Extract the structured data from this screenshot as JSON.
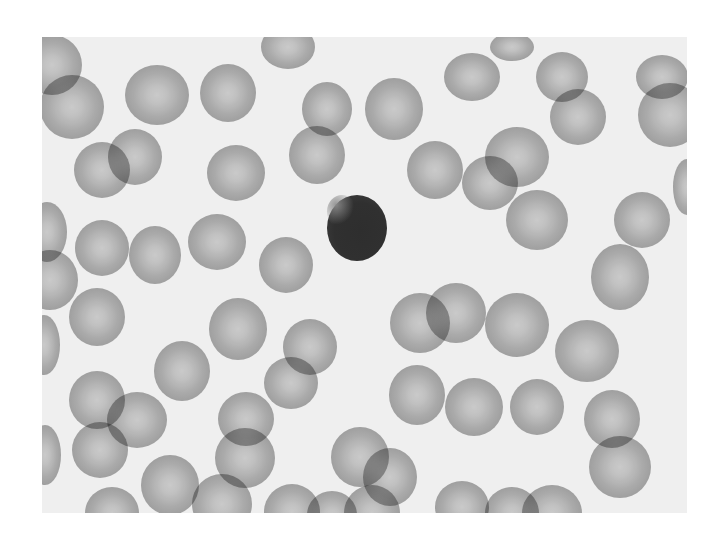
{
  "image": {
    "subject": "Peripheral blood smear micrograph (grayscale)",
    "description": "Numerous red blood cells with central pallor surrounding a single dark-staining small lymphocyte near the center",
    "background_color": "#efefef",
    "page_background": "#ffffff",
    "rbc_color": "#a8a8a8",
    "rbc_pallor_color": "#d6d6d6",
    "lymphocyte_color": "#303030"
  },
  "frame": {
    "x": 42,
    "y": 37,
    "width": 645,
    "height": 476
  },
  "lymphocyte": {
    "cx": 357,
    "cy": 228,
    "rx": 30,
    "ry": 33
  },
  "cells": [
    {
      "cx": 10,
      "cy": 28,
      "rx": 30,
      "ry": 30
    },
    {
      "cx": 30,
      "cy": 70,
      "rx": 32,
      "ry": 32
    },
    {
      "cx": 115,
      "cy": 58,
      "rx": 32,
      "ry": 30
    },
    {
      "cx": 186,
      "cy": 56,
      "rx": 28,
      "ry": 29
    },
    {
      "cx": 246,
      "cy": 10,
      "rx": 27,
      "ry": 22
    },
    {
      "cx": 285,
      "cy": 72,
      "rx": 25,
      "ry": 27
    },
    {
      "cx": 352,
      "cy": 72,
      "rx": 29,
      "ry": 31
    },
    {
      "cx": 430,
      "cy": 40,
      "rx": 28,
      "ry": 24
    },
    {
      "cx": 470,
      "cy": 10,
      "rx": 22,
      "ry": 14
    },
    {
      "cx": 520,
      "cy": 40,
      "rx": 26,
      "ry": 25
    },
    {
      "cx": 536,
      "cy": 80,
      "rx": 28,
      "ry": 28
    },
    {
      "cx": 620,
      "cy": 40,
      "rx": 26,
      "ry": 22
    },
    {
      "cx": 628,
      "cy": 78,
      "rx": 32,
      "ry": 32
    },
    {
      "cx": 645,
      "cy": 150,
      "rx": 14,
      "ry": 28
    },
    {
      "cx": 60,
      "cy": 133,
      "rx": 28,
      "ry": 28
    },
    {
      "cx": 93,
      "cy": 120,
      "rx": 27,
      "ry": 28
    },
    {
      "cx": 194,
      "cy": 136,
      "rx": 29,
      "ry": 28
    },
    {
      "cx": 275,
      "cy": 118,
      "rx": 28,
      "ry": 29
    },
    {
      "cx": 393,
      "cy": 133,
      "rx": 28,
      "ry": 29
    },
    {
      "cx": 475,
      "cy": 120,
      "rx": 32,
      "ry": 30
    },
    {
      "cx": 448,
      "cy": 146,
      "rx": 28,
      "ry": 27
    },
    {
      "cx": 600,
      "cy": 183,
      "rx": 28,
      "ry": 28
    },
    {
      "cx": 5,
      "cy": 195,
      "rx": 20,
      "ry": 30
    },
    {
      "cx": 60,
      "cy": 211,
      "rx": 27,
      "ry": 28
    },
    {
      "cx": 113,
      "cy": 218,
      "rx": 26,
      "ry": 29
    },
    {
      "cx": 175,
      "cy": 205,
      "rx": 29,
      "ry": 28
    },
    {
      "cx": 244,
      "cy": 228,
      "rx": 27,
      "ry": 28
    },
    {
      "cx": 495,
      "cy": 183,
      "rx": 31,
      "ry": 30
    },
    {
      "cx": 578,
      "cy": 240,
      "rx": 29,
      "ry": 33
    },
    {
      "cx": 8,
      "cy": 243,
      "rx": 28,
      "ry": 30
    },
    {
      "cx": 55,
      "cy": 280,
      "rx": 28,
      "ry": 29
    },
    {
      "cx": 196,
      "cy": 292,
      "rx": 29,
      "ry": 31
    },
    {
      "cx": 378,
      "cy": 286,
      "rx": 30,
      "ry": 30
    },
    {
      "cx": 414,
      "cy": 276,
      "rx": 30,
      "ry": 30
    },
    {
      "cx": 475,
      "cy": 288,
      "rx": 32,
      "ry": 32
    },
    {
      "cx": 140,
      "cy": 334,
      "rx": 28,
      "ry": 30
    },
    {
      "cx": 249,
      "cy": 346,
      "rx": 27,
      "ry": 26
    },
    {
      "cx": 204,
      "cy": 382,
      "rx": 28,
      "ry": 27
    },
    {
      "cx": 268,
      "cy": 310,
      "rx": 27,
      "ry": 28
    },
    {
      "cx": 2,
      "cy": 308,
      "rx": 16,
      "ry": 30
    },
    {
      "cx": 545,
      "cy": 314,
      "rx": 32,
      "ry": 31
    },
    {
      "cx": 375,
      "cy": 358,
      "rx": 28,
      "ry": 30
    },
    {
      "cx": 432,
      "cy": 370,
      "rx": 29,
      "ry": 29
    },
    {
      "cx": 495,
      "cy": 370,
      "rx": 27,
      "ry": 28
    },
    {
      "cx": 570,
      "cy": 382,
      "rx": 28,
      "ry": 29
    },
    {
      "cx": 578,
      "cy": 430,
      "rx": 31,
      "ry": 31
    },
    {
      "cx": 55,
      "cy": 363,
      "rx": 28,
      "ry": 29
    },
    {
      "cx": 95,
      "cy": 383,
      "rx": 30,
      "ry": 28
    },
    {
      "cx": 58,
      "cy": 413,
      "rx": 28,
      "ry": 28
    },
    {
      "cx": 3,
      "cy": 418,
      "rx": 16,
      "ry": 30
    },
    {
      "cx": 128,
      "cy": 448,
      "rx": 29,
      "ry": 30
    },
    {
      "cx": 203,
      "cy": 421,
      "rx": 30,
      "ry": 30
    },
    {
      "cx": 180,
      "cy": 467,
      "rx": 30,
      "ry": 30
    },
    {
      "cx": 250,
      "cy": 475,
      "rx": 28,
      "ry": 28
    },
    {
      "cx": 318,
      "cy": 420,
      "rx": 29,
      "ry": 30
    },
    {
      "cx": 348,
      "cy": 440,
      "rx": 27,
      "ry": 29
    },
    {
      "cx": 290,
      "cy": 478,
      "rx": 25,
      "ry": 24
    },
    {
      "cx": 330,
      "cy": 476,
      "rx": 28,
      "ry": 28
    },
    {
      "cx": 420,
      "cy": 470,
      "rx": 27,
      "ry": 26
    },
    {
      "cx": 470,
      "cy": 476,
      "rx": 27,
      "ry": 26
    },
    {
      "cx": 510,
      "cy": 476,
      "rx": 30,
      "ry": 28
    },
    {
      "cx": 70,
      "cy": 476,
      "rx": 27,
      "ry": 26
    },
    {
      "cx": 260,
      "cy": 220,
      "rx": 0,
      "ry": 0
    }
  ]
}
